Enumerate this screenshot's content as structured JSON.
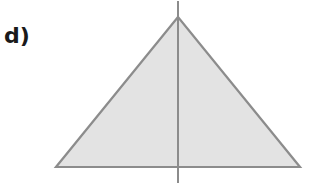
{
  "label": "d)",
  "figure": {
    "shape": "isosceles-triangle",
    "fill_color": "#e3e3e3",
    "stroke_color": "#8c8c8c",
    "symmetry_line": "vertical"
  }
}
